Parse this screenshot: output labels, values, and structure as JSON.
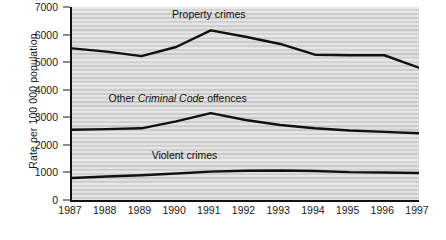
{
  "chart_data": {
    "type": "line",
    "title": "",
    "subtitle": "",
    "xlabel": "",
    "ylabel": "Rate per 100 000 population",
    "x": [
      1987,
      1988,
      1989,
      1990,
      1991,
      1992,
      1993,
      1994,
      1995,
      1996,
      1997
    ],
    "categories": [
      "1987",
      "1988",
      "1989",
      "1990",
      "1991",
      "1992",
      "1993",
      "1994",
      "1995",
      "1996",
      "1997"
    ],
    "xlim": [
      1987,
      1997
    ],
    "ylim": [
      0,
      7000
    ],
    "yticks": [
      0,
      1000,
      2000,
      3000,
      4000,
      5000,
      6000,
      7000
    ],
    "yticklabels": [
      "0",
      "1000",
      "2000",
      "3000",
      "4000",
      "5000",
      "6000",
      "7000"
    ],
    "grid": false,
    "legend_position": "inline-annotations",
    "plot_background": "#d8d8d8",
    "line_color": "#111111",
    "series": [
      {
        "name": "Property crimes",
        "label": "Property crimes",
        "values": [
          5500,
          5380,
          5220,
          5550,
          6150,
          5920,
          5660,
          5270,
          5250,
          5250,
          4800
        ]
      },
      {
        "name": "Other Criminal Code offences",
        "label_prefix": "Other ",
        "label_italic": "Criminal Code",
        "label_suffix": " offences",
        "values": [
          2550,
          2570,
          2600,
          2850,
          3150,
          2900,
          2720,
          2600,
          2520,
          2470,
          2420
        ]
      },
      {
        "name": "Violent crimes",
        "label": "Violent crimes",
        "values": [
          800,
          850,
          900,
          960,
          1030,
          1060,
          1070,
          1050,
          1010,
          1000,
          980
        ]
      }
    ],
    "annotations": [
      {
        "text": "Property crimes",
        "x": 1991,
        "y": 6700
      },
      {
        "text": "Other Criminal Code offences",
        "x": 1990.1,
        "y": 3650
      },
      {
        "text": "Violent crimes",
        "x": 1990.3,
        "y": 1580
      }
    ]
  }
}
